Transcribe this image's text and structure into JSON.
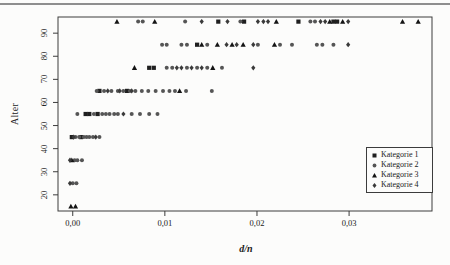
{
  "figure": {
    "y_axis_label": "Alter",
    "x_axis_label": "d/n"
  },
  "colors": {
    "plot_border": "#3c3c3c",
    "tick": "#3c3c3c",
    "page_rule": "#8e8e8e",
    "background": "#fcfcfb"
  },
  "legend": {
    "items": [
      {
        "label": "Kategorie 1",
        "marker": "square",
        "glyph": "■",
        "color": "#1f1f1f"
      },
      {
        "label": "Kategorie 2",
        "marker": "circle",
        "glyph": "●",
        "color": "#555555"
      },
      {
        "label": "Kategorie 3",
        "marker": "triangle",
        "glyph": "▲",
        "color": "#141414"
      },
      {
        "label": "Kategorie 4",
        "marker": "diamond",
        "glyph": "♦",
        "color": "#3a3a3a"
      }
    ]
  },
  "chart_data": {
    "type": "scatter",
    "title": "",
    "xlabel": "d/n",
    "ylabel": "Alter",
    "xlim": [
      -0.0016,
      0.039
    ],
    "ylim": [
      13,
      97
    ],
    "grid": false,
    "legend_position": "inside-right-middle",
    "x_ticks": [
      {
        "value": 0.0,
        "label": "0,00"
      },
      {
        "value": 0.01,
        "label": "0,01"
      },
      {
        "value": 0.02,
        "label": "0,02"
      },
      {
        "value": 0.03,
        "label": "0,03"
      }
    ],
    "y_ticks": [
      {
        "value": 20,
        "label": "20"
      },
      {
        "value": 30,
        "label": "30"
      },
      {
        "value": 40,
        "label": "40"
      },
      {
        "value": 50,
        "label": "50"
      },
      {
        "value": 60,
        "label": "60"
      },
      {
        "value": 70,
        "label": "70"
      },
      {
        "value": 80,
        "label": "80"
      },
      {
        "value": 90,
        "label": "90"
      }
    ],
    "age_bands": [
      15,
      25,
      35,
      45,
      55,
      65,
      75,
      85,
      95
    ],
    "series": [
      {
        "name": "Kategorie 1",
        "marker": "square",
        "color": "#1f1f1f",
        "points": [
          [
            0.0158,
            95
          ],
          [
            0.0186,
            95
          ],
          [
            0.0245,
            95
          ],
          [
            0.0283,
            95
          ],
          [
            0.0287,
            95
          ],
          [
            0.0135,
            85
          ],
          [
            0.0083,
            75
          ],
          [
            0.0088,
            75
          ],
          [
            0.0029,
            65
          ],
          [
            0.0059,
            65
          ],
          [
            0.0014,
            55
          ],
          [
            0.0018,
            55
          ],
          [
            0.0027,
            55
          ],
          [
            -0.0001,
            45
          ],
          [
            0.0009,
            45
          ]
        ]
      },
      {
        "name": "Kategorie 2",
        "marker": "circle",
        "color": "#555555",
        "points": [
          [
            0.0071,
            95
          ],
          [
            0.0076,
            95
          ],
          [
            0.0122,
            95
          ],
          [
            0.0182,
            95
          ],
          [
            0.0258,
            95
          ],
          [
            0.0263,
            95
          ],
          [
            0.0097,
            85
          ],
          [
            0.0102,
            85
          ],
          [
            0.0118,
            85
          ],
          [
            0.0124,
            85
          ],
          [
            0.0146,
            85
          ],
          [
            0.0201,
            85
          ],
          [
            0.0225,
            85
          ],
          [
            0.0238,
            85
          ],
          [
            0.0265,
            85
          ],
          [
            0.0271,
            85
          ],
          [
            0.0283,
            85
          ],
          [
            0.0102,
            75
          ],
          [
            0.0108,
            75
          ],
          [
            0.0124,
            75
          ],
          [
            0.0135,
            75
          ],
          [
            0.0146,
            75
          ],
          [
            0.0162,
            75
          ],
          [
            0.0026,
            65
          ],
          [
            0.0034,
            65
          ],
          [
            0.0042,
            65
          ],
          [
            0.0049,
            65
          ],
          [
            0.0055,
            65
          ],
          [
            0.0062,
            65
          ],
          [
            0.0068,
            65
          ],
          [
            0.0075,
            65
          ],
          [
            0.0082,
            65
          ],
          [
            0.009,
            65
          ],
          [
            0.0098,
            65
          ],
          [
            0.0105,
            65
          ],
          [
            0.0111,
            65
          ],
          [
            0.0123,
            65
          ],
          [
            0.0151,
            65
          ],
          [
            0.0005,
            55
          ],
          [
            0.0023,
            55
          ],
          [
            0.0032,
            55
          ],
          [
            0.0036,
            55
          ],
          [
            0.004,
            55
          ],
          [
            0.0045,
            55
          ],
          [
            0.0049,
            55
          ],
          [
            0.0064,
            55
          ],
          [
            0.0073,
            55
          ],
          [
            0.0083,
            55
          ],
          [
            0.0092,
            55
          ],
          [
            0.0003,
            45
          ],
          [
            0.0007,
            45
          ],
          [
            0.0012,
            45
          ],
          [
            0.0015,
            45
          ],
          [
            0.0018,
            45
          ],
          [
            0.0022,
            45
          ],
          [
            0.0029,
            45
          ],
          [
            0.0002,
            35
          ],
          [
            0.0005,
            35
          ],
          [
            0.001,
            35
          ],
          [
            0.0,
            25
          ],
          [
            0.0004,
            25
          ]
        ]
      },
      {
        "name": "Kategorie 3",
        "marker": "triangle",
        "color": "#141414",
        "points": [
          [
            0.0048,
            95
          ],
          [
            0.0089,
            95
          ],
          [
            0.0221,
            95
          ],
          [
            0.0279,
            95
          ],
          [
            0.0293,
            95
          ],
          [
            0.0358,
            95
          ],
          [
            0.0375,
            95
          ],
          [
            0.014,
            85
          ],
          [
            0.0157,
            85
          ],
          [
            0.0173,
            85
          ],
          [
            0.0185,
            85
          ],
          [
            0.0219,
            85
          ],
          [
            0.0067,
            75
          ],
          [
            0.0152,
            75
          ],
          [
            0.0116,
            65
          ],
          [
            -0.0001,
            35
          ],
          [
            -0.0002,
            15
          ],
          [
            0.0003,
            15
          ]
        ]
      },
      {
        "name": "Kategorie 4",
        "marker": "diamond",
        "color": "#3a3a3a",
        "points": [
          [
            0.014,
            95
          ],
          [
            0.0168,
            95
          ],
          [
            0.0201,
            95
          ],
          [
            0.0207,
            95
          ],
          [
            0.0212,
            95
          ],
          [
            0.0269,
            95
          ],
          [
            0.0274,
            95
          ],
          [
            0.0299,
            95
          ],
          [
            0.0167,
            85
          ],
          [
            0.0178,
            85
          ],
          [
            0.0196,
            85
          ],
          [
            0.0299,
            85
          ],
          [
            0.0113,
            75
          ],
          [
            0.0118,
            75
          ],
          [
            0.0129,
            75
          ],
          [
            0.014,
            75
          ],
          [
            0.0196,
            75
          ],
          [
            0.0038,
            65
          ],
          [
            0.0051,
            65
          ],
          [
            0.0064,
            65
          ],
          [
            0.0055,
            55
          ],
          [
            0.0001,
            45
          ],
          [
            0.0025,
            45
          ],
          [
            -0.0003,
            35
          ],
          [
            -0.0003,
            25
          ]
        ]
      }
    ]
  }
}
